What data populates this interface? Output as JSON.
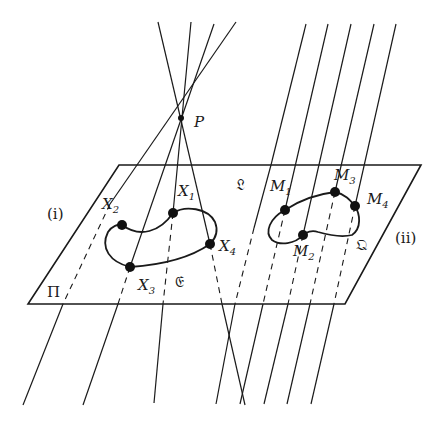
{
  "diagram": {
    "plane": {
      "label": "Π",
      "line_label": "𝔏",
      "corners": [
        [
          119,
          165
        ],
        [
          421,
          165
        ],
        [
          345,
          304
        ],
        [
          28,
          304
        ]
      ]
    },
    "center": {
      "label": "P",
      "x": 181,
      "y": 118
    },
    "region_labels": {
      "left": "(i)",
      "right": "(ii)"
    },
    "curve_left": {
      "label": "𝔈",
      "points": [
        {
          "name": "X",
          "sub": "1",
          "x": 173,
          "y": 213
        },
        {
          "name": "X",
          "sub": "2",
          "x": 122,
          "y": 225
        },
        {
          "name": "X",
          "sub": "3",
          "x": 130,
          "y": 267
        },
        {
          "name": "X",
          "sub": "4",
          "x": 210,
          "y": 244
        }
      ]
    },
    "curve_right": {
      "label": "𝔔",
      "points": [
        {
          "name": "M",
          "sub": "1",
          "x": 285,
          "y": 210
        },
        {
          "name": "M",
          "sub": "2",
          "x": 303,
          "y": 235
        },
        {
          "name": "M",
          "sub": "3",
          "x": 335,
          "y": 192
        },
        {
          "name": "M",
          "sub": "4",
          "x": 355,
          "y": 206
        }
      ]
    }
  }
}
